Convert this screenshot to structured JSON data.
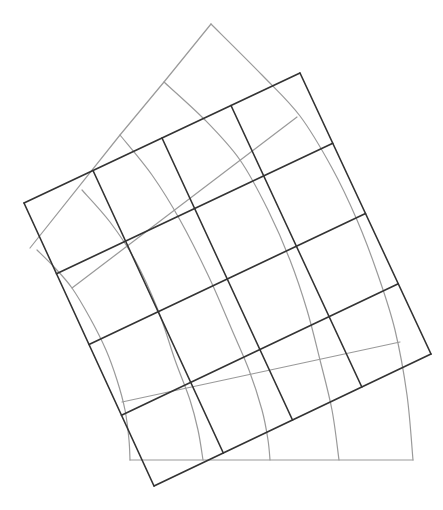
{
  "diagram": {
    "colors": {
      "background": "#ffffff",
      "regular_grid": "#333333",
      "warped_grid": "#9a9a9a"
    },
    "stroke_widths": {
      "regular_grid": 1.6,
      "warped_grid": 1.2
    },
    "regular_grid": {
      "rows": 4,
      "cols": 4,
      "corners": {
        "top_left": [
          24,
          203
        ],
        "top_right": [
          300,
          73
        ],
        "bottom_right": [
          431,
          354
        ],
        "bottom_left": [
          154,
          486
        ]
      }
    },
    "warped_grid": {
      "arcs": [
        {
          "name": "arc-a",
          "points": [
            [
              211,
              24
            ],
            [
              262,
              75
            ],
            [
              300,
              116
            ],
            [
              332,
              168
            ],
            [
              357,
              220
            ],
            [
              378,
              275
            ],
            [
              395,
              330
            ],
            [
              407,
              395
            ],
            [
              413,
              460
            ]
          ]
        },
        {
          "name": "arc-b",
          "points": [
            [
              164,
              82
            ],
            [
              205,
              120
            ],
            [
              240,
              160
            ],
            [
              268,
              210
            ],
            [
              290,
              260
            ],
            [
              307,
              310
            ],
            [
              320,
              360
            ],
            [
              332,
              410
            ],
            [
              339,
              460
            ]
          ]
        },
        {
          "name": "arc-c",
          "points": [
            [
              120,
              135
            ],
            [
              152,
              175
            ],
            [
              180,
              220
            ],
            [
              208,
              275
            ],
            [
              232,
              330
            ],
            [
              249,
              370
            ],
            [
              262,
              410
            ],
            [
              268,
              440
            ],
            [
              270,
              460
            ]
          ]
        },
        {
          "name": "arc-d",
          "points": [
            [
              82,
              190
            ],
            [
              110,
              222
            ],
            [
              135,
              260
            ],
            [
              158,
              310
            ],
            [
              175,
              360
            ],
            [
              190,
              400
            ],
            [
              198,
              430
            ],
            [
              203,
              460
            ]
          ]
        },
        {
          "name": "arc-e",
          "points": [
            [
              37,
              250
            ],
            [
              55,
              268
            ],
            [
              72,
              288
            ],
            [
              90,
              318
            ],
            [
              106,
              350
            ],
            [
              117,
              380
            ],
            [
              125,
              410
            ],
            [
              129,
              440
            ],
            [
              130,
              460
            ]
          ]
        }
      ],
      "lines": [
        {
          "name": "warped-top-edge",
          "points": [
            [
              211,
              24
            ],
            [
              164,
              82
            ],
            [
              120,
              135
            ],
            [
              30,
              248
            ]
          ]
        },
        {
          "name": "warped-row-line-1",
          "points": [
            [
              72,
              288
            ],
            [
              297,
              117
            ]
          ]
        },
        {
          "name": "warped-row-line-3",
          "points": [
            [
              122,
              402
            ],
            [
              400,
              342
            ]
          ]
        },
        {
          "name": "warped-bottom-edge",
          "points": [
            [
              130,
              460
            ],
            [
              413,
              460
            ]
          ]
        }
      ]
    }
  }
}
